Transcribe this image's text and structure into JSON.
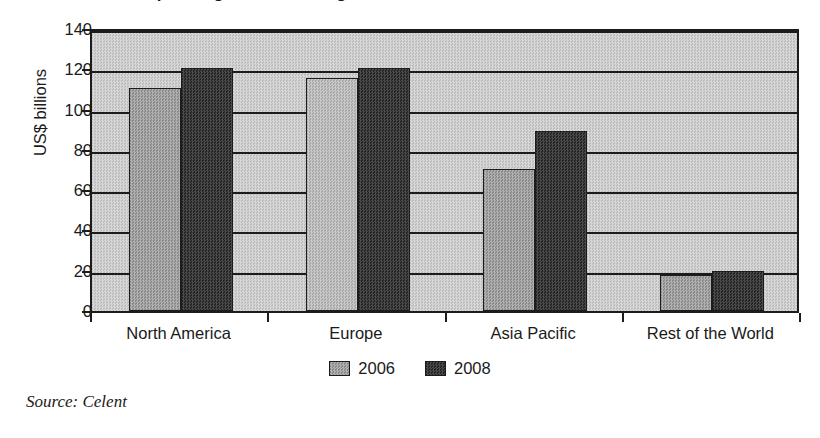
{
  "figure": {
    "title_cropped": "Global spending on risk management",
    "source_note": "Source: Celent"
  },
  "chart_data": {
    "type": "bar",
    "title": "",
    "xlabel": "",
    "ylabel": "US$ billions",
    "ylim": [
      0,
      140
    ],
    "yticks": [
      0,
      20,
      40,
      60,
      80,
      100,
      120,
      140
    ],
    "ytick_labels": [
      "0",
      "20",
      "40",
      "60",
      "80",
      "100",
      "120",
      "140"
    ],
    "grid": "horizontal",
    "legend_position": "bottom-center",
    "categories": [
      "North America",
      "Europe",
      "Asia Pacific",
      "Rest of the World"
    ],
    "series": [
      {
        "name": "2006",
        "color": "#9d9d9d",
        "values": [
          110,
          115,
          70,
          17.5
        ]
      },
      {
        "name": "2008",
        "color": "#3a3a3a",
        "values": [
          120,
          120,
          89,
          19.5
        ]
      }
    ]
  }
}
